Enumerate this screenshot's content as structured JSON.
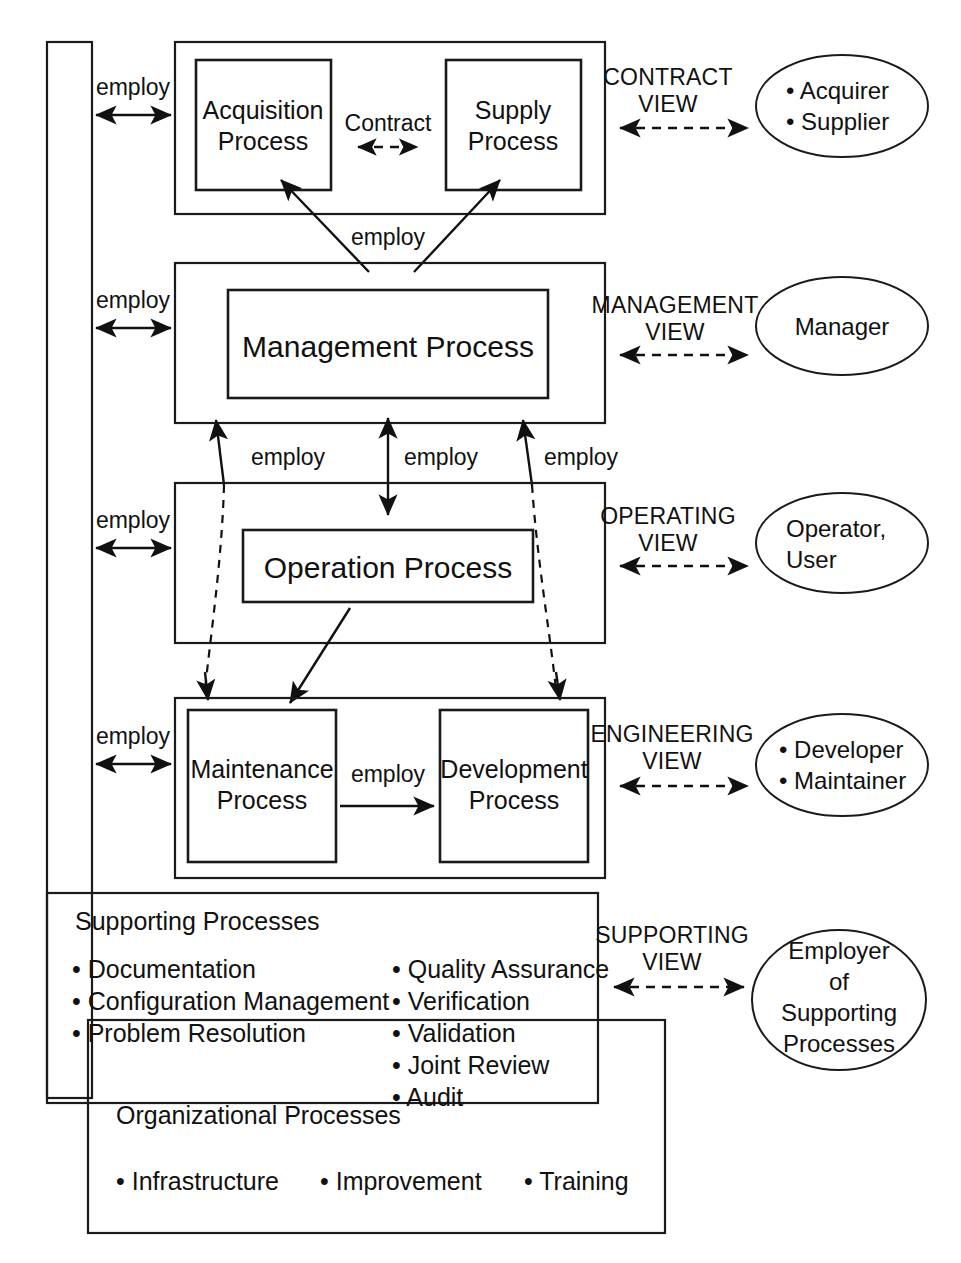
{
  "diagram": {
    "left_employ_labels": [
      "employ",
      "employ",
      "employ",
      "employ"
    ],
    "inner_employ_labels": [
      "employ",
      "employ",
      "employ",
      "employ",
      "employ"
    ],
    "contract_label": "Contract",
    "layers": [
      {
        "id": "contract",
        "view_label_line1": "CONTRACT",
        "view_label_line2": "VIEW",
        "processes": [
          {
            "line1": "Acquisition",
            "line2": "Process"
          },
          {
            "line1": "Supply",
            "line2": "Process"
          }
        ],
        "actor_lines": [
          "• Acquirer",
          "• Supplier"
        ]
      },
      {
        "id": "management",
        "view_label_line1": "MANAGEMENT",
        "view_label_line2": "VIEW",
        "processes": [
          {
            "line1": "Management Process",
            "line2": ""
          }
        ],
        "actor_lines": [
          "Manager"
        ]
      },
      {
        "id": "operating",
        "view_label_line1": "OPERATING",
        "view_label_line2": "VIEW",
        "processes": [
          {
            "line1": "Operation Process",
            "line2": ""
          }
        ],
        "actor_lines": [
          "Operator,",
          "User"
        ]
      },
      {
        "id": "engineering",
        "view_label_line1": "ENGINEERING",
        "view_label_line2": "VIEW",
        "processes": [
          {
            "line1": "Maintenance",
            "line2": "Process"
          },
          {
            "line1": "Development",
            "line2": "Process"
          }
        ],
        "actor_lines": [
          "• Developer",
          "• Maintainer"
        ]
      },
      {
        "id": "supporting",
        "view_label_line1": "SUPPORTING",
        "view_label_line2": "VIEW",
        "processes": [],
        "actor_lines": [
          "Employer",
          "of",
          "Supporting",
          "Processes"
        ]
      }
    ],
    "supporting": {
      "heading": "Supporting Processes",
      "column_left": [
        "• Documentation",
        "• Configuration Management",
        "• Problem Resolution"
      ],
      "column_right": [
        "• Quality Assurance",
        "• Verification",
        "• Validation",
        "• Joint Review",
        "• Audit"
      ]
    },
    "organizational": {
      "heading": "Organizational Processes",
      "items": [
        "• Infrastructure",
        "• Improvement",
        "• Training"
      ]
    },
    "colors": {
      "line": "#1a1a1a",
      "text": "#111111",
      "background": "#ffffff"
    }
  }
}
